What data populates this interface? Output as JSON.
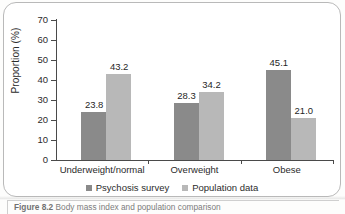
{
  "figure": {
    "caption_prefix": "Figure 8.2",
    "caption_text": " Body mass index and population comparison"
  },
  "chart_data": {
    "type": "bar",
    "title": "",
    "xlabel": "",
    "ylabel": "Proportion (%)",
    "ylim": [
      0,
      70
    ],
    "ytick_step": 10,
    "yticks": [
      "0",
      "10",
      "20",
      "30",
      "40",
      "50",
      "60",
      "70"
    ],
    "grid": false,
    "legend_position": "bottom",
    "categories": [
      "Underweight/normal",
      "Overweight",
      "Obese"
    ],
    "series": [
      {
        "name": "Psychosis survey",
        "color": "#8a8a8a",
        "values": [
          23.8,
          28.3,
          45.1
        ],
        "labels": [
          "23.8",
          "28.3",
          "45.1"
        ]
      },
      {
        "name": "Population data",
        "color": "#b8b8b8",
        "values": [
          43.2,
          34.2,
          21.0
        ],
        "labels": [
          "43.2",
          "34.2",
          "21.0"
        ]
      }
    ]
  }
}
